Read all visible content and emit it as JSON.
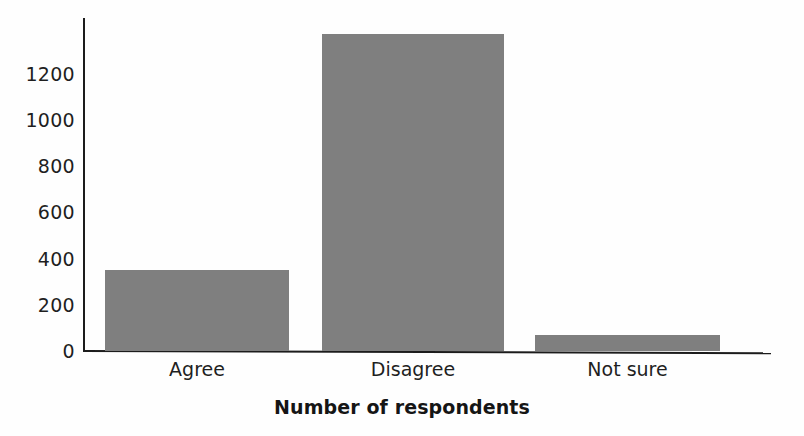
{
  "chart_data": {
    "type": "bar",
    "title": "",
    "subtitle": "",
    "xlabel": "Number of respondents",
    "ylabel": "",
    "categories": [
      "Agree",
      "Disagree",
      "Not sure"
    ],
    "values": [
      350,
      1370,
      70
    ],
    "ylim": [
      0,
      1440
    ],
    "yticks": [
      0,
      200,
      400,
      600,
      800,
      1000,
      1200
    ],
    "ytick_labels": [
      "0",
      "200",
      "400",
      "600",
      "800",
      "1000",
      "1200"
    ],
    "grid": false,
    "legend": false,
    "legend_position": "none",
    "bar_color": "#7f7f7f",
    "axis_color": "#1c1c1c",
    "text_color": "#1f1f1f",
    "series": [
      {
        "name": "Number of respondents",
        "values": [
          350,
          1370,
          70
        ]
      }
    ]
  }
}
